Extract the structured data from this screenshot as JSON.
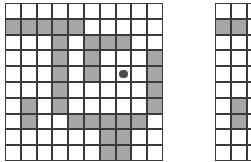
{
  "figure": {
    "type": "grid-occupancy-diagram",
    "background_color": "#ffffff",
    "panel_count": 2,
    "cell_size_px": 15.8,
    "grid_line_color": "#3a3a3a",
    "filled_cell_color": "#a6a6a6",
    "empty_cell_color": "#ffffff",
    "marker_color": "#4d4d4d"
  },
  "panels": [
    {
      "id": "left-grid",
      "name": "main-occupancy-grid",
      "origin_x": 5,
      "origin_y": 3,
      "clip_width": 159,
      "clip_height": 159,
      "columns": 10,
      "rows": 10,
      "filled_cells": [
        [
          2,
          1
        ],
        [
          2,
          2
        ],
        [
          2,
          3
        ],
        [
          2,
          4
        ],
        [
          2,
          5
        ],
        [
          3,
          4
        ],
        [
          3,
          6
        ],
        [
          3,
          7
        ],
        [
          3,
          8
        ],
        [
          4,
          4
        ],
        [
          4,
          6
        ],
        [
          4,
          10
        ],
        [
          5,
          4
        ],
        [
          5,
          6
        ],
        [
          5,
          10
        ],
        [
          6,
          4
        ],
        [
          6,
          10
        ],
        [
          7,
          2
        ],
        [
          7,
          4
        ],
        [
          7,
          10
        ],
        [
          8,
          2
        ],
        [
          8,
          5
        ],
        [
          8,
          6
        ],
        [
          8,
          7
        ],
        [
          8,
          8
        ],
        [
          8,
          9
        ],
        [
          9,
          7
        ],
        [
          9,
          8
        ],
        [
          10,
          7
        ],
        [
          10,
          8
        ]
      ],
      "markers": [
        {
          "name": "center-position-dot",
          "row": 5,
          "column": 8,
          "radius_px": 4.2,
          "label": ""
        }
      ]
    },
    {
      "id": "right-grid-fragment",
      "name": "secondary-occupancy-grid-fragment",
      "origin_x": 215,
      "origin_y": 3,
      "clip_width": 36,
      "clip_height": 159,
      "columns": 10,
      "rows": 10,
      "filled_cells": [
        [
          2,
          1
        ],
        [
          2,
          2
        ],
        [
          7,
          2
        ],
        [
          8,
          2
        ]
      ],
      "markers": []
    }
  ]
}
